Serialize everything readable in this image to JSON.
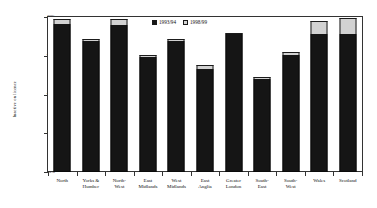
{
  "chart_data": {
    "type": "bar",
    "subtype": "stacked-bar",
    "title": "",
    "xlabel": "",
    "ylabel": "Inactive on licence",
    "ylim": [
      0,
      40
    ],
    "y_unit": "%",
    "grid": false,
    "legend_position": "top-center",
    "categories": [
      "North",
      "Yorks & Humber",
      "North-West",
      "East Midlands",
      "West Midlands",
      "East Anglia",
      "Greater London",
      "South-East",
      "South-West",
      "Wales",
      "Scotland"
    ],
    "category_lines": [
      [
        "North"
      ],
      [
        "Yorks &",
        "Humber"
      ],
      [
        "North-",
        "West"
      ],
      [
        "East",
        "Midlands"
      ],
      [
        "West",
        "Midlands"
      ],
      [
        "East",
        "Anglia"
      ],
      [
        "Greater",
        "London"
      ],
      [
        "South-",
        "East"
      ],
      [
        "South-",
        "West"
      ],
      [
        "Wales"
      ],
      [
        "Scotland"
      ]
    ],
    "series": [
      {
        "name": "1993/94",
        "color": "#151515",
        "values": [
          38.3,
          33.7,
          38.0,
          29.7,
          33.7,
          26.6,
          35.7,
          24.0,
          30.3,
          35.7,
          35.7
        ]
      },
      {
        "name": "1998/99",
        "color": "#d2d2d2",
        "values": [
          1.1,
          0.6,
          1.4,
          0.6,
          0.6,
          0.9,
          0.3,
          0.6,
          0.6,
          3.4,
          4.0
        ]
      }
    ],
    "totals": [
      39.4,
      34.3,
      39.4,
      30.3,
      34.3,
      27.4,
      36.0,
      24.6,
      30.9,
      39.1,
      39.7
    ],
    "yticks": [
      0,
      10,
      20,
      30,
      40
    ],
    "ytick_labels": [
      "0%",
      "10%",
      "20%",
      "30%",
      "40%"
    ]
  },
  "legend": {
    "items": [
      {
        "label": "1993/94",
        "swatch": "dark"
      },
      {
        "label": "1998/99",
        "swatch": "light"
      }
    ]
  }
}
